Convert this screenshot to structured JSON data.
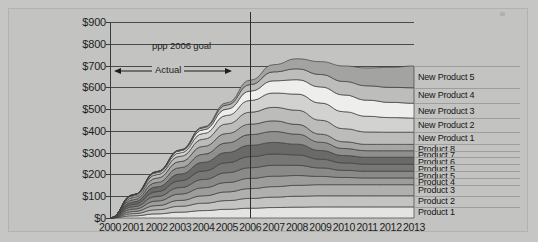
{
  "figure": {
    "annotations": {
      "goal_marker_label": "ppp 2006 goal",
      "actual_span_label": "Actual"
    }
  },
  "chart_data": {
    "type": "area",
    "stacked": true,
    "title": "",
    "subtitle": "",
    "xlabel": "",
    "ylabel": "",
    "grid": true,
    "legend_position": "right",
    "ylim": [
      0,
      900
    ],
    "xlim": [
      2000,
      2013
    ],
    "y_tick_labels": [
      "$0",
      "$100",
      "$200",
      "$300",
      "$400",
      "$500",
      "$600",
      "$700",
      "$800",
      "$900"
    ],
    "y_tick_values": [
      0,
      100,
      200,
      300,
      400,
      500,
      600,
      700,
      800,
      900
    ],
    "categories": [
      2000,
      2001,
      2002,
      2003,
      2004,
      2005,
      2006,
      2007,
      2008,
      2009,
      2010,
      2011,
      2012,
      2013
    ],
    "x_tick_labels": [
      "2000",
      "2001",
      "2002",
      "2003",
      "2004",
      "2005",
      "2006",
      "2007",
      "2008",
      "2009",
      "2010",
      "2011",
      "2012",
      "2013"
    ],
    "annotations": [
      {
        "name": "goal-marker",
        "type": "vline",
        "x": 2006,
        "label": "ppp 2006 goal"
      },
      {
        "name": "actual-span",
        "type": "double-arrow",
        "x_from": 2000,
        "x_to": 2006,
        "y": 640,
        "label": "Actual"
      }
    ],
    "series": [
      {
        "name": "Product 1",
        "color": "#e4e4e2",
        "values": [
          0,
          10,
          19,
          27,
          34,
          40,
          45,
          48,
          50,
          51,
          51,
          51,
          51,
          51
        ]
      },
      {
        "name": "Product 2",
        "color": "#c4c4c2",
        "values": [
          0,
          10,
          19,
          27,
          34,
          40,
          45,
          48,
          50,
          51,
          51,
          51,
          51,
          51
        ]
      },
      {
        "name": "Product 3",
        "color": "#b0b0ae",
        "values": [
          0,
          10,
          19,
          27,
          34,
          40,
          45,
          48,
          50,
          51,
          51,
          51,
          51,
          51
        ]
      },
      {
        "name": "Product 4",
        "color": "#9d9d9b",
        "values": [
          0,
          11,
          21,
          29,
          37,
          43,
          47,
          48,
          45,
          38,
          33,
          31,
          31,
          31
        ]
      },
      {
        "name": "Product 5",
        "color": "#8a8a88",
        "values": [
          0,
          11,
          21,
          30,
          38,
          45,
          49,
          50,
          47,
          39,
          33,
          31,
          31,
          31
        ]
      },
      {
        "name": "Product 5 ",
        "color": "#777775",
        "values": [
          0,
          11,
          22,
          31,
          39,
          46,
          51,
          52,
          48,
          40,
          34,
          32,
          32,
          32
        ]
      },
      {
        "name": "Product 6",
        "color": "#6a6a68",
        "values": [
          0,
          11,
          22,
          31,
          40,
          47,
          52,
          53,
          49,
          40,
          34,
          32,
          32,
          32
        ]
      },
      {
        "name": "Product 7",
        "color": "#8f8f8d",
        "values": [
          0,
          10,
          20,
          29,
          37,
          44,
          49,
          50,
          46,
          38,
          32,
          30,
          30,
          30
        ]
      },
      {
        "name": "Product 8",
        "color": "#a6a6a4",
        "values": [
          0,
          10,
          20,
          28,
          36,
          43,
          48,
          49,
          45,
          37,
          31,
          29,
          29,
          29
        ]
      },
      {
        "name": "New Product 1",
        "color": "#bcbcba",
        "values": [
          0,
          8,
          16,
          24,
          33,
          44,
          55,
          62,
          65,
          64,
          60,
          57,
          56,
          56
        ]
      },
      {
        "name": "New Product 2",
        "color": "#d2d2d0",
        "values": [
          0,
          4,
          9,
          16,
          26,
          39,
          54,
          66,
          74,
          79,
          78,
          72,
          67,
          65
        ]
      },
      {
        "name": "New Product 3",
        "color": "#eeeeec",
        "values": [
          0,
          1,
          4,
          9,
          17,
          29,
          43,
          56,
          66,
          74,
          77,
          74,
          70,
          68
        ]
      },
      {
        "name": "New Product 4",
        "color": "#bdbdbb",
        "values": [
          0,
          0,
          1,
          4,
          10,
          19,
          30,
          41,
          50,
          57,
          62,
          66,
          69,
          71
        ]
      },
      {
        "name": "New Product 5",
        "color": "#a3a3a1",
        "values": [
          0,
          0,
          0,
          1,
          4,
          10,
          20,
          33,
          46,
          59,
          71,
          82,
          92,
          100
        ]
      }
    ],
    "stack_totals": [
      0,
      97,
      194,
      286,
      385,
      489,
      588,
      656,
      681,
      667,
      647,
      638,
      641,
      648
    ],
    "legend_entries": [
      "New Product 5",
      "New Product 4",
      "New Product 3",
      "New Product 2",
      "New Product 1",
      "Product 8",
      "Product 7",
      "Product 6",
      "Product 5",
      "Product 5",
      "Product 4",
      "Product 3",
      "Product 2",
      "Product 1"
    ]
  }
}
